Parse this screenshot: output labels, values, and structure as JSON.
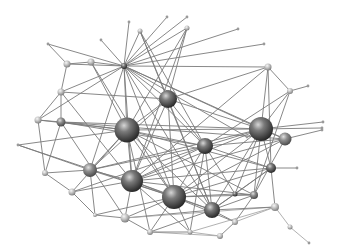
{
  "diagram": {
    "type": "network-graph",
    "width": 340,
    "height": 252,
    "colors": {
      "background": "#ffffff",
      "edge": "#7a7a7a",
      "edge_light": "#a8a8a8",
      "node_dark_highlight": "#cfcfcf",
      "node_dark_mid": "#6e6e6e",
      "node_dark_shadow": "#262626",
      "node_light_highlight": "#f2f2f2",
      "node_light_mid": "#b5b5b5",
      "node_light_shadow": "#7d7d7d"
    },
    "nodes": [
      {
        "id": "n0",
        "x": 127,
        "y": 130,
        "r": 12.5,
        "tone": "dark"
      },
      {
        "id": "n1",
        "x": 168,
        "y": 99,
        "r": 9,
        "tone": "dark"
      },
      {
        "id": "n2",
        "x": 261,
        "y": 129,
        "r": 12,
        "tone": "dark"
      },
      {
        "id": "n3",
        "x": 205,
        "y": 146,
        "r": 8,
        "tone": "dark"
      },
      {
        "id": "n4",
        "x": 132,
        "y": 181,
        "r": 11,
        "tone": "dark"
      },
      {
        "id": "n5",
        "x": 174,
        "y": 197,
        "r": 12,
        "tone": "dark"
      },
      {
        "id": "n6",
        "x": 212,
        "y": 210,
        "r": 8,
        "tone": "dark"
      },
      {
        "id": "n7",
        "x": 271,
        "y": 168,
        "r": 5,
        "tone": "dark"
      },
      {
        "id": "n8",
        "x": 124,
        "y": 66,
        "r": 3,
        "tone": "dark"
      },
      {
        "id": "n9",
        "x": 285,
        "y": 139,
        "r": 6.5,
        "tone": "mid"
      },
      {
        "id": "n10",
        "x": 90,
        "y": 170,
        "r": 7,
        "tone": "mid"
      },
      {
        "id": "n11",
        "x": 61,
        "y": 122,
        "r": 4.5,
        "tone": "mid"
      },
      {
        "id": "n12",
        "x": 254,
        "y": 195,
        "r": 4,
        "tone": "mid"
      },
      {
        "id": "n13",
        "x": 67,
        "y": 64,
        "r": 3.5,
        "tone": "light"
      },
      {
        "id": "n14",
        "x": 91,
        "y": 62,
        "r": 3.5,
        "tone": "light"
      },
      {
        "id": "n15",
        "x": 61,
        "y": 92,
        "r": 3.5,
        "tone": "light"
      },
      {
        "id": "n16",
        "x": 38,
        "y": 120,
        "r": 3.5,
        "tone": "light"
      },
      {
        "id": "n17",
        "x": 45,
        "y": 173,
        "r": 3,
        "tone": "light"
      },
      {
        "id": "n18",
        "x": 72,
        "y": 192,
        "r": 3.5,
        "tone": "light"
      },
      {
        "id": "n19",
        "x": 125,
        "y": 218,
        "r": 4.5,
        "tone": "light"
      },
      {
        "id": "n20",
        "x": 150,
        "y": 232,
        "r": 3,
        "tone": "light"
      },
      {
        "id": "n21",
        "x": 220,
        "y": 236,
        "r": 3,
        "tone": "light"
      },
      {
        "id": "n22",
        "x": 235,
        "y": 222,
        "r": 3,
        "tone": "light"
      },
      {
        "id": "n23",
        "x": 275,
        "y": 207,
        "r": 4,
        "tone": "light"
      },
      {
        "id": "n24",
        "x": 268,
        "y": 67,
        "r": 3.5,
        "tone": "light"
      },
      {
        "id": "n25",
        "x": 290,
        "y": 91,
        "r": 3,
        "tone": "light"
      },
      {
        "id": "n26",
        "x": 140,
        "y": 31,
        "r": 2.5,
        "tone": "light"
      },
      {
        "id": "n27",
        "x": 187,
        "y": 28,
        "r": 2.5,
        "tone": "light"
      },
      {
        "id": "n28",
        "x": 95,
        "y": 215,
        "r": 2,
        "tone": "light"
      },
      {
        "id": "n29",
        "x": 290,
        "y": 227,
        "r": 2.5,
        "tone": "light"
      },
      {
        "id": "n30",
        "x": 235,
        "y": 194,
        "r": 2.5,
        "tone": "dark"
      },
      {
        "id": "n31",
        "x": 190,
        "y": 232,
        "r": 2.5,
        "tone": "light"
      }
    ],
    "endpoints": [
      {
        "id": "e0",
        "x": 48,
        "y": 44
      },
      {
        "id": "e1",
        "x": 101,
        "y": 40
      },
      {
        "id": "e2",
        "x": 129,
        "y": 22
      },
      {
        "id": "e3",
        "x": 167,
        "y": 17
      },
      {
        "id": "e4",
        "x": 187,
        "y": 17
      },
      {
        "id": "e5",
        "x": 238,
        "y": 29
      },
      {
        "id": "e6",
        "x": 264,
        "y": 44
      },
      {
        "id": "e7",
        "x": 308,
        "y": 86
      },
      {
        "id": "e8",
        "x": 323,
        "y": 122
      },
      {
        "id": "e9",
        "x": 322,
        "y": 128
      },
      {
        "id": "e10",
        "x": 297,
        "y": 168
      },
      {
        "id": "e11",
        "x": 18,
        "y": 145
      },
      {
        "id": "e12",
        "x": 309,
        "y": 243
      },
      {
        "id": "e13",
        "x": 322,
        "y": 130
      },
      {
        "id": "e14",
        "x": 247,
        "y": 137
      }
    ],
    "edges": [
      [
        "n8",
        "e0"
      ],
      [
        "n8",
        "e1"
      ],
      [
        "n8",
        "e2"
      ],
      [
        "n8",
        "e3"
      ],
      [
        "n8",
        "e4"
      ],
      [
        "n8",
        "e5"
      ],
      [
        "n8",
        "e6"
      ],
      [
        "n8",
        "n24"
      ],
      [
        "n8",
        "n13"
      ],
      [
        "n8",
        "n14"
      ],
      [
        "n8",
        "n0"
      ],
      [
        "n8",
        "n1"
      ],
      [
        "n8",
        "n2"
      ],
      [
        "n8",
        "n3"
      ],
      [
        "n8",
        "n4"
      ],
      [
        "n8",
        "n10"
      ],
      [
        "n8",
        "n5"
      ],
      [
        "n8",
        "n6"
      ],
      [
        "n8",
        "n9"
      ],
      [
        "n8",
        "n15"
      ],
      [
        "n8",
        "n16"
      ],
      [
        "n8",
        "n26"
      ],
      [
        "n8",
        "n27"
      ],
      [
        "n8",
        "e14"
      ],
      [
        "n13",
        "e0"
      ],
      [
        "n13",
        "n14"
      ],
      [
        "n13",
        "n15"
      ],
      [
        "n14",
        "n0"
      ],
      [
        "n14",
        "n5"
      ],
      [
        "n15",
        "n16"
      ],
      [
        "n15",
        "n11"
      ],
      [
        "n15",
        "n1"
      ],
      [
        "n15",
        "n4"
      ],
      [
        "n16",
        "n11"
      ],
      [
        "n16",
        "n17"
      ],
      [
        "n16",
        "n0"
      ],
      [
        "n11",
        "n0"
      ],
      [
        "n11",
        "n3"
      ],
      [
        "n11",
        "n2"
      ],
      [
        "n11",
        "n19"
      ],
      [
        "n11",
        "n9"
      ],
      [
        "e11",
        "n10"
      ],
      [
        "e11",
        "n0"
      ],
      [
        "e11",
        "n5"
      ],
      [
        "n17",
        "n18"
      ],
      [
        "n17",
        "n10"
      ],
      [
        "n17",
        "n11"
      ],
      [
        "n18",
        "n4"
      ],
      [
        "n18",
        "n28"
      ],
      [
        "n18",
        "n0"
      ],
      [
        "n18",
        "n3"
      ],
      [
        "n28",
        "n19"
      ],
      [
        "n28",
        "n5"
      ],
      [
        "n28",
        "n10"
      ],
      [
        "n10",
        "n0"
      ],
      [
        "n10",
        "n4"
      ],
      [
        "n10",
        "n5"
      ],
      [
        "n10",
        "n2"
      ],
      [
        "n10",
        "n3"
      ],
      [
        "n19",
        "n4"
      ],
      [
        "n19",
        "n5"
      ],
      [
        "n19",
        "n6"
      ],
      [
        "n19",
        "n23"
      ],
      [
        "n19",
        "n20"
      ],
      [
        "n20",
        "n5"
      ],
      [
        "n20",
        "n6"
      ],
      [
        "n20",
        "n21"
      ],
      [
        "n20",
        "n0"
      ],
      [
        "n0",
        "n1"
      ],
      [
        "n0",
        "n3"
      ],
      [
        "n0",
        "n4"
      ],
      [
        "n0",
        "n5"
      ],
      [
        "n0",
        "n2"
      ],
      [
        "n0",
        "n6"
      ],
      [
        "n0",
        "n7"
      ],
      [
        "n0",
        "n12"
      ],
      [
        "n1",
        "n26"
      ],
      [
        "n1",
        "n27"
      ],
      [
        "n1",
        "n3"
      ],
      [
        "n1",
        "n2"
      ],
      [
        "n1",
        "n5"
      ],
      [
        "n1",
        "n4"
      ],
      [
        "n1",
        "n24"
      ],
      [
        "n1",
        "n6"
      ],
      [
        "n1",
        "n10"
      ],
      [
        "n26",
        "n3"
      ],
      [
        "n26",
        "n6"
      ],
      [
        "n27",
        "n4"
      ],
      [
        "n27",
        "n0"
      ],
      [
        "n24",
        "n25"
      ],
      [
        "n24",
        "n2"
      ],
      [
        "n24",
        "n7"
      ],
      [
        "n24",
        "n4"
      ],
      [
        "n25",
        "e7"
      ],
      [
        "n25",
        "n2"
      ],
      [
        "n25",
        "n12"
      ],
      [
        "n25",
        "n3"
      ],
      [
        "n2",
        "n9"
      ],
      [
        "n2",
        "n3"
      ],
      [
        "n2",
        "n4"
      ],
      [
        "n2",
        "n5"
      ],
      [
        "n2",
        "n6"
      ],
      [
        "n2",
        "n7"
      ],
      [
        "n2",
        "n12"
      ],
      [
        "n2",
        "e9"
      ],
      [
        "n2",
        "n30"
      ],
      [
        "n9",
        "e13"
      ],
      [
        "n9",
        "n3"
      ],
      [
        "n9",
        "n5"
      ],
      [
        "n9",
        "n4"
      ],
      [
        "n9",
        "n12"
      ],
      [
        "n3",
        "n4"
      ],
      [
        "n3",
        "n5"
      ],
      [
        "n3",
        "n6"
      ],
      [
        "n3",
        "n7"
      ],
      [
        "n3",
        "n30"
      ],
      [
        "n3",
        "n31"
      ],
      [
        "n7",
        "e10"
      ],
      [
        "n7",
        "n23"
      ],
      [
        "n7",
        "n5"
      ],
      [
        "n7",
        "n4"
      ],
      [
        "n7",
        "n6"
      ],
      [
        "n7",
        "n30"
      ],
      [
        "n4",
        "n5"
      ],
      [
        "n4",
        "n6"
      ],
      [
        "n4",
        "n12"
      ],
      [
        "n4",
        "n31"
      ],
      [
        "n5",
        "n6"
      ],
      [
        "n5",
        "n12"
      ],
      [
        "n5",
        "n22"
      ],
      [
        "n5",
        "n30"
      ],
      [
        "n5",
        "n31"
      ],
      [
        "n6",
        "n22"
      ],
      [
        "n6",
        "n12"
      ],
      [
        "n6",
        "n23"
      ],
      [
        "n6",
        "n30"
      ],
      [
        "n12",
        "n30"
      ],
      [
        "n12",
        "n22"
      ],
      [
        "n22",
        "n23"
      ],
      [
        "n22",
        "n21"
      ],
      [
        "n21",
        "n31"
      ],
      [
        "n31",
        "n20"
      ],
      [
        "n23",
        "n29"
      ],
      [
        "n29",
        "e12"
      ],
      [
        "n23",
        "n31"
      ],
      [
        "e8",
        "n2"
      ],
      [
        "e14",
        "n2"
      ]
    ],
    "light_edges": [
      [
        "n19",
        "n23"
      ],
      [
        "n20",
        "n21"
      ],
      [
        "n22",
        "n23"
      ],
      [
        "n21",
        "n31"
      ],
      [
        "n23",
        "n29"
      ],
      [
        "n29",
        "e12"
      ],
      [
        "n23",
        "n31"
      ]
    ]
  }
}
